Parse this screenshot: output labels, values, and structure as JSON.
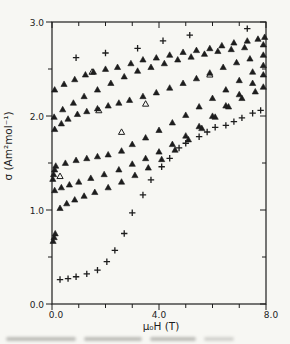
{
  "figure": {
    "background": "#f7f7f3",
    "ink": "#1d1d1d"
  },
  "chart_data": {
    "type": "scatter",
    "title": "",
    "xlabel": "μ₀H  (T)",
    "ylabel": "σ  (Am²mol⁻¹)",
    "xlim": [
      0,
      8
    ],
    "ylim": [
      0,
      3
    ],
    "grid": false,
    "legend": null,
    "frame": "box",
    "x_major_ticks": [
      0,
      4,
      8
    ],
    "x_major_labels": [
      "0.0",
      "4.0",
      "8.0"
    ],
    "x_minor_step": 1,
    "y_major_ticks": [
      0,
      1,
      2,
      3
    ],
    "y_major_labels": [
      "0.0",
      "1.0",
      "2.0",
      "3.0"
    ],
    "y_minor_step": 0.5,
    "series": [
      {
        "name": "isotherm-1-plus-high",
        "marker": "plus",
        "points": [
          [
            0.9,
            2.62
          ],
          [
            2.0,
            2.67
          ],
          [
            3.2,
            2.72
          ],
          [
            4.15,
            2.8
          ],
          [
            5.15,
            2.86
          ],
          [
            7.3,
            2.93
          ]
        ]
      },
      {
        "name": "isotherm-2-triangles",
        "marker": "triangle-filled",
        "points": [
          [
            0.1,
            2.28
          ],
          [
            0.45,
            2.34
          ],
          [
            0.85,
            2.39
          ],
          [
            1.25,
            2.44
          ],
          [
            1.55,
            2.47
          ],
          [
            2.0,
            2.5
          ],
          [
            2.45,
            2.52
          ],
          [
            2.95,
            2.56
          ],
          [
            3.4,
            2.6
          ],
          [
            3.9,
            2.62
          ],
          [
            4.4,
            2.65
          ],
          [
            4.9,
            2.68
          ],
          [
            5.4,
            2.7
          ],
          [
            5.9,
            2.72
          ],
          [
            6.35,
            2.75
          ],
          [
            6.8,
            2.78
          ],
          [
            7.3,
            2.8
          ],
          [
            7.7,
            2.82
          ],
          [
            7.95,
            2.84
          ]
        ]
      },
      {
        "name": "isotherm-3-triangles",
        "marker": "triangle-filled",
        "points": [
          [
            0.08,
            1.99
          ],
          [
            0.4,
            2.07
          ],
          [
            0.8,
            2.14
          ],
          [
            1.2,
            2.21
          ],
          [
            1.7,
            2.28
          ],
          [
            2.2,
            2.35
          ],
          [
            2.7,
            2.42
          ],
          [
            3.2,
            2.48
          ],
          [
            3.7,
            2.52
          ],
          [
            4.2,
            2.56
          ],
          [
            4.7,
            2.6
          ],
          [
            5.2,
            2.63
          ],
          [
            5.7,
            2.66
          ],
          [
            6.2,
            2.69
          ],
          [
            6.7,
            2.71
          ],
          [
            7.2,
            2.73
          ],
          [
            7.9,
            2.76
          ]
        ]
      },
      {
        "name": "isotherm-4-triangles",
        "marker": "triangle-filled",
        "points": [
          [
            0.1,
            1.86
          ],
          [
            0.35,
            1.92
          ],
          [
            0.6,
            1.97
          ],
          [
            0.95,
            2.02
          ],
          [
            1.3,
            2.05
          ],
          [
            1.7,
            2.08
          ],
          [
            2.1,
            2.11
          ],
          [
            2.5,
            2.14
          ],
          [
            2.9,
            2.17
          ],
          [
            3.4,
            2.21
          ],
          [
            3.9,
            2.25
          ],
          [
            4.4,
            2.3
          ],
          [
            4.9,
            2.35
          ],
          [
            5.4,
            2.4
          ],
          [
            5.9,
            2.46
          ],
          [
            6.4,
            2.52
          ],
          [
            6.9,
            2.57
          ],
          [
            7.4,
            2.61
          ],
          [
            7.9,
            2.65
          ]
        ]
      },
      {
        "name": "isotherm-5-triangles",
        "marker": "triangle-filled",
        "points": [
          [
            0.03,
            1.33
          ],
          [
            0.06,
            1.38
          ],
          [
            0.1,
            1.43
          ],
          [
            0.14,
            1.47
          ],
          [
            0.5,
            1.5
          ],
          [
            0.9,
            1.53
          ],
          [
            1.3,
            1.55
          ],
          [
            1.7,
            1.57
          ],
          [
            2.1,
            1.59
          ],
          [
            2.6,
            1.63
          ],
          [
            3.0,
            1.7
          ],
          [
            3.5,
            1.77
          ],
          [
            4.0,
            1.85
          ],
          [
            4.5,
            1.93
          ],
          [
            5.0,
            2.01
          ],
          [
            5.5,
            2.1
          ],
          [
            6.0,
            2.19
          ],
          [
            6.5,
            2.28
          ],
          [
            7.0,
            2.38
          ],
          [
            7.5,
            2.47
          ],
          [
            7.9,
            2.54
          ]
        ]
      },
      {
        "name": "isotherm-6-triangles",
        "marker": "triangle-filled",
        "points": [
          [
            0.1,
            1.21
          ],
          [
            0.35,
            1.24
          ],
          [
            0.65,
            1.27
          ],
          [
            1.0,
            1.3
          ],
          [
            1.45,
            1.34
          ],
          [
            1.95,
            1.38
          ],
          [
            2.5,
            1.43
          ],
          [
            3.0,
            1.49
          ],
          [
            3.5,
            1.55
          ],
          [
            4.0,
            1.62
          ],
          [
            4.5,
            1.7
          ],
          [
            5.0,
            1.79
          ],
          [
            5.5,
            1.89
          ],
          [
            6.0,
            2.0
          ],
          [
            6.5,
            2.11
          ],
          [
            7.0,
            2.23
          ],
          [
            7.5,
            2.35
          ],
          [
            7.9,
            2.44
          ]
        ]
      },
      {
        "name": "isotherm-7-triangles",
        "marker": "triangle-filled",
        "points": [
          [
            0.04,
            0.67
          ],
          [
            0.08,
            0.71
          ],
          [
            0.12,
            0.75
          ],
          [
            0.3,
            1.02
          ],
          [
            0.55,
            1.07
          ],
          [
            0.85,
            1.11
          ],
          [
            1.2,
            1.15
          ],
          [
            1.6,
            1.19
          ],
          [
            2.1,
            1.24
          ],
          [
            2.6,
            1.3
          ],
          [
            3.1,
            1.37
          ],
          [
            3.6,
            1.45
          ],
          [
            4.1,
            1.54
          ],
          [
            4.6,
            1.64
          ],
          [
            5.1,
            1.75
          ],
          [
            5.6,
            1.87
          ],
          [
            6.1,
            1.99
          ],
          [
            6.6,
            2.1
          ],
          [
            7.1,
            2.19
          ],
          [
            7.6,
            2.26
          ],
          [
            7.9,
            2.31
          ]
        ]
      },
      {
        "name": "open-triangle-points",
        "marker": "triangle-open",
        "points": [
          [
            0.3,
            1.36
          ],
          [
            1.5,
            2.47
          ],
          [
            1.75,
            2.06
          ],
          [
            3.5,
            2.13
          ],
          [
            2.6,
            1.83
          ],
          [
            5.9,
            2.44
          ]
        ]
      },
      {
        "name": "isotherm-8-plus-sigmoid",
        "marker": "plus",
        "points": [
          [
            0.3,
            0.26
          ],
          [
            0.6,
            0.27
          ],
          [
            0.9,
            0.29
          ],
          [
            1.3,
            0.32
          ],
          [
            1.7,
            0.36
          ],
          [
            2.05,
            0.45
          ],
          [
            2.35,
            0.57
          ],
          [
            2.7,
            0.75
          ],
          [
            3.0,
            0.97
          ],
          [
            3.4,
            1.16
          ],
          [
            3.7,
            1.32
          ],
          [
            4.1,
            1.46
          ],
          [
            4.4,
            1.55
          ],
          [
            4.75,
            1.66
          ],
          [
            5.0,
            1.71
          ],
          [
            5.5,
            1.78
          ],
          [
            5.8,
            1.83
          ],
          [
            6.1,
            1.88
          ],
          [
            6.5,
            1.9
          ],
          [
            6.8,
            1.94
          ],
          [
            7.1,
            1.98
          ],
          [
            7.5,
            2.03
          ],
          [
            7.8,
            2.06
          ]
        ]
      }
    ]
  }
}
